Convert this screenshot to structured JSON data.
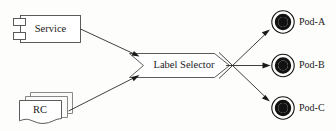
{
  "diagram": {
    "background_color": "#fdfdfb",
    "line_color": "#2a2a2a",
    "shape_fill": "#ffffff",
    "shape_stroke": "#4a4a4a",
    "pod_color": "#111111"
  },
  "sources": [
    {
      "id": "service",
      "label": "Service",
      "shape": "uml-component",
      "icon": "component-icon"
    },
    {
      "id": "rc",
      "label": "RC",
      "shape": "document-stack",
      "icon": "document-stack-icon",
      "stack_count": 3
    }
  ],
  "router": {
    "id": "label-selector",
    "label": "Label Selector",
    "shape": "chevron"
  },
  "targets": [
    {
      "id": "pod-a",
      "label": "Pod-A",
      "shape": "concentric-circle",
      "icon": "pod-icon"
    },
    {
      "id": "pod-b",
      "label": "Pod-B",
      "shape": "concentric-circle",
      "icon": "pod-icon"
    },
    {
      "id": "pod-c",
      "label": "Pod-C",
      "shape": "concentric-circle",
      "icon": "pod-icon"
    }
  ],
  "connections": [
    {
      "id": "service-to-selector",
      "from": "service",
      "to": "label-selector",
      "arrow": true
    },
    {
      "id": "rc-to-selector",
      "from": "rc",
      "to": "label-selector",
      "arrow": true
    },
    {
      "id": "selector-to-pod-a",
      "from": "label-selector",
      "to": "pod-a",
      "arrow": true
    },
    {
      "id": "selector-to-pod-b",
      "from": "label-selector",
      "to": "pod-b",
      "arrow": true
    },
    {
      "id": "selector-to-pod-c",
      "from": "label-selector",
      "to": "pod-c",
      "arrow": true
    }
  ]
}
